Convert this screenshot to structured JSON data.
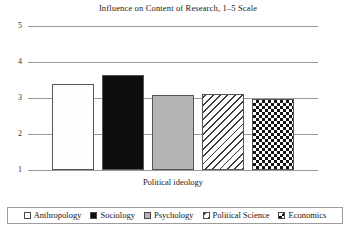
{
  "chart_data": {
    "type": "bar",
    "title": "Influence on Content of Research, 1–5 Scale",
    "xlabel": "Political ideology",
    "ylabel": "",
    "categories": [
      "Anthropology",
      "Sociology",
      "Psychology",
      "Political Science",
      "Economics"
    ],
    "values": [
      3.4,
      3.65,
      3.08,
      3.11,
      2.97
    ],
    "ylim": [
      1,
      5
    ],
    "yticks": [
      "5",
      "4",
      "3",
      "2",
      "1"
    ],
    "ytick_values": [
      5,
      4,
      3,
      2,
      1
    ],
    "grid": true,
    "legend_position": "bottom",
    "series": [
      {
        "name": "Influence on Content of Research",
        "values": [
          3.4,
          3.65,
          3.08,
          3.11,
          2.97
        ]
      }
    ],
    "bar_patterns": [
      "dots",
      "solid-black",
      "gray",
      "diagonal-hatch",
      "checkerboard"
    ]
  },
  "legend": {
    "items": [
      {
        "label": "Anthropology",
        "pattern": "dots"
      },
      {
        "label": "Sociology",
        "pattern": "solid-black"
      },
      {
        "label": "Psychology",
        "pattern": "gray"
      },
      {
        "label": "Political Science",
        "pattern": "diagonal-hatch"
      },
      {
        "label": "Economics",
        "pattern": "checkerboard"
      }
    ]
  },
  "colors": {
    "gridline": "#9a9a9a",
    "bar_outline": "#555555",
    "black_fill": "#0d0d0d",
    "gray_fill": "#b4b4b4",
    "background": "#ffffff",
    "text": "#1a1a1a"
  }
}
